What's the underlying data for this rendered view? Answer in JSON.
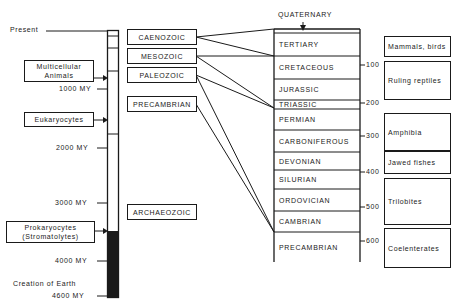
{
  "timescale": {
    "top_label": "Present",
    "ticks": [
      {
        "label": "1000 MY",
        "y": 89
      },
      {
        "label": "2000 MY",
        "y": 148
      },
      {
        "label": "3000 MY",
        "y": 203
      },
      {
        "label": "4000 MY",
        "y": 261
      },
      {
        "label": "4600 MY",
        "y": 296
      }
    ],
    "bottom_caption": "Creation of Earth"
  },
  "life_events": [
    {
      "label_line1": "Multicellular",
      "label_line2": "Animals"
    },
    {
      "label_line1": "Eukaryocytes",
      "label_line2": ""
    },
    {
      "label_line1": "Prokaryocytes",
      "label_line2": "(Stromatolytes)"
    }
  ],
  "eras": [
    {
      "label": "CAENOZOIC"
    },
    {
      "label": "MESOZOIC"
    },
    {
      "label": "PALEOZOIC"
    },
    {
      "label": "PRECAMBRIAN"
    },
    {
      "label": "ARCHAEOZOIC"
    }
  ],
  "periods_header": "QUATERNARY",
  "periods": [
    {
      "label": "TERTIARY"
    },
    {
      "label": "CRETACEOUS"
    },
    {
      "label": "JURASSIC"
    },
    {
      "label": "TRIASSIC"
    },
    {
      "label": "PERMIAN"
    },
    {
      "label": "CARBONIFEROUS"
    },
    {
      "label": "DEVONIAN"
    },
    {
      "label": "SILURIAN"
    },
    {
      "label": "ORDOVICIAN"
    },
    {
      "label": "CAMBRIAN"
    },
    {
      "label": "PRECAMBRIAN"
    }
  ],
  "period_ticks": [
    {
      "label": "100"
    },
    {
      "label": "200"
    },
    {
      "label": "300"
    },
    {
      "label": "400"
    },
    {
      "label": "500"
    },
    {
      "label": "600"
    }
  ],
  "life_forms": [
    {
      "label": "Mammals, birds"
    },
    {
      "label": "Ruling reptiles"
    },
    {
      "label": "Amphibia"
    },
    {
      "label": "Jawed fishes"
    },
    {
      "label": "Trilobites"
    },
    {
      "label": "Coelenterates"
    }
  ]
}
